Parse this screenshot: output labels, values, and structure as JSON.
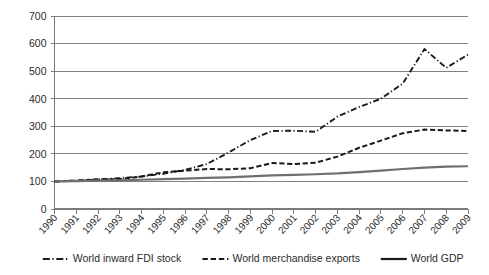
{
  "chart_data": {
    "type": "line",
    "title": "",
    "subtitle": "",
    "xlabel": "",
    "ylabel": "",
    "x": [
      1990,
      1991,
      1992,
      1993,
      1994,
      1995,
      1996,
      1997,
      1998,
      1999,
      2000,
      2001,
      2002,
      2003,
      2004,
      2005,
      2006,
      2007,
      2008,
      2009
    ],
    "categories": [
      "1990",
      "1991",
      "1992",
      "1993",
      "1994",
      "1995",
      "1996",
      "1997",
      "1998",
      "1999",
      "2000",
      "2001",
      "2002",
      "2003",
      "2004",
      "2005",
      "2006",
      "2007",
      "2008",
      "2009"
    ],
    "xlim": [
      1990,
      2009
    ],
    "ylim": [
      0,
      700
    ],
    "yticks": [
      0,
      100,
      200,
      300,
      400,
      500,
      600,
      700
    ],
    "ytick_labels": [
      "0",
      "100",
      "200",
      "300",
      "400",
      "500",
      "600",
      "700"
    ],
    "grid": true,
    "grid_axis": "y",
    "legend_position": "bottom",
    "series": [
      {
        "name": "World inward FDI stock",
        "style": "dash-dot",
        "color": "#1a1a1a",
        "values": [
          100,
          103,
          107,
          112,
          118,
          128,
          142,
          163,
          205,
          250,
          283,
          284,
          280,
          335,
          370,
          400,
          455,
          580,
          512,
          560
        ]
      },
      {
        "name": "World merchandise exports",
        "style": "dashed",
        "color": "#1a1a1a",
        "values": [
          100,
          103,
          108,
          108,
          118,
          133,
          139,
          145,
          144,
          148,
          167,
          163,
          168,
          190,
          222,
          248,
          275,
          288,
          285,
          283
        ]
      },
      {
        "name": "World GDP",
        "style": "solid",
        "color": "#6f6f6f",
        "values": [
          100,
          101,
          103,
          104,
          106,
          108,
          110,
          113,
          115,
          118,
          122,
          124,
          126,
          129,
          134,
          139,
          145,
          150,
          154,
          155
        ]
      }
    ]
  },
  "legend": {
    "items": [
      {
        "label": "World inward FDI stock",
        "style": "dash-dot"
      },
      {
        "label": "World merchandise exports",
        "style": "dashed"
      },
      {
        "label": "World GDP",
        "style": "solid"
      }
    ]
  }
}
